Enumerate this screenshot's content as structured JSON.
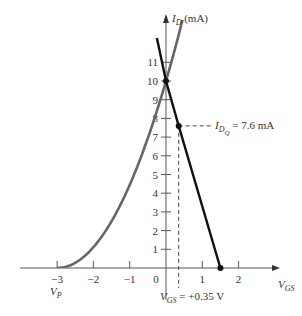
{
  "chart_data": {
    "type": "line",
    "title": "",
    "xlabel": "V_GS",
    "ylabel": "I_D (mA)",
    "xlim": [
      -3.5,
      3.0
    ],
    "ylim": [
      0,
      12
    ],
    "grid": false,
    "x_ticks": [
      -3,
      -2,
      -1,
      0,
      1,
      2
    ],
    "x_tick_labels": [
      "−3",
      "−2",
      "−1",
      "0",
      "1",
      "2"
    ],
    "y_ticks": [
      1,
      2,
      3,
      4,
      5,
      6,
      7,
      8,
      9,
      10,
      11
    ],
    "y_tick_labels": [
      "1",
      "2",
      "3",
      "4",
      "5",
      "6",
      "7",
      "8",
      "9",
      "10",
      "11"
    ],
    "series": [
      {
        "name": "Transfer curve (Shockley)",
        "color": "#666666",
        "params": {
          "IDSS_mA": 10,
          "VP_V": -3
        },
        "x": [
          -3,
          -2.5,
          -2,
          -1.5,
          -1,
          -0.5,
          0,
          0.5,
          1.0,
          1.15
        ],
        "values": [
          0,
          0.28,
          1.11,
          2.5,
          4.44,
          6.94,
          10,
          13.6,
          17.8,
          19.1
        ]
      },
      {
        "name": "Load line",
        "color": "#111111",
        "x": [
          -0.25,
          0,
          0.35,
          1.5
        ],
        "values": [
          12.3,
          10,
          7.6,
          0
        ]
      }
    ],
    "points": [
      {
        "name": "IDSS intercept",
        "x": 0,
        "y": 10
      },
      {
        "name": "Q-point",
        "x": 0.35,
        "y": 7.6
      },
      {
        "name": "load-line x-intercept",
        "x": 1.5,
        "y": 0
      }
    ],
    "annotations": {
      "q_current": {
        "main": "I",
        "sub": "D",
        "subsub": "Q",
        "text": " = 7.6 mA"
      },
      "q_voltage": {
        "main": "V",
        "sub": "GS",
        "text": " = +0.35 V"
      },
      "pinch_off": {
        "main": "V",
        "sub": "P"
      },
      "y_axis": {
        "main": "I",
        "sub": "D",
        "text": " (mA)"
      },
      "x_axis": {
        "main": "V",
        "sub": "GS"
      }
    }
  }
}
